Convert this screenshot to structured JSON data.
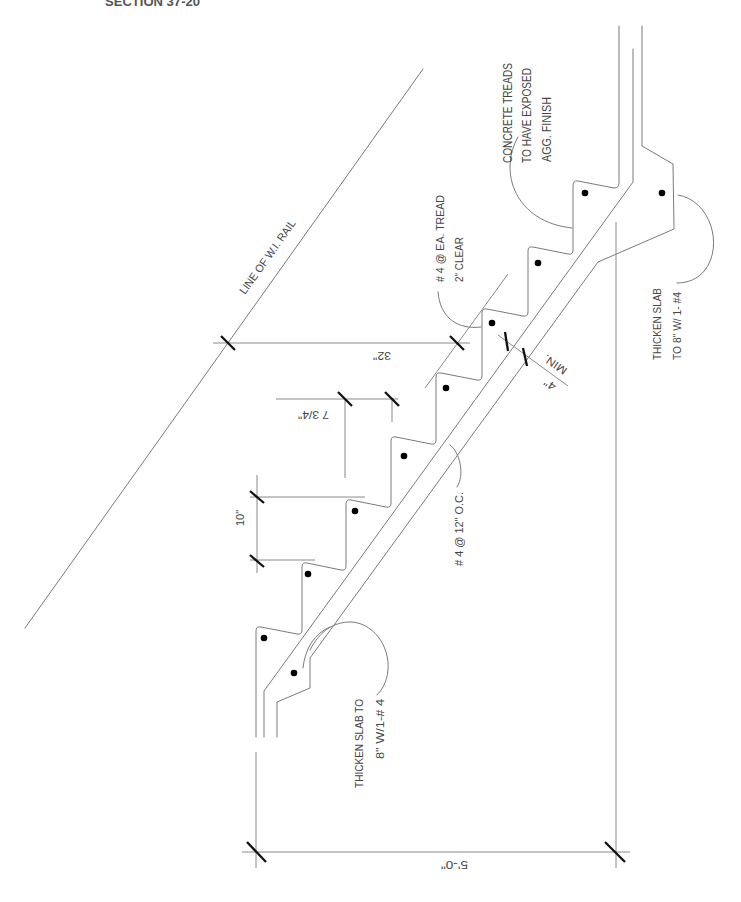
{
  "drawing": {
    "title": "SECTION 37-20",
    "type": "concrete stair section"
  },
  "labels": {
    "concrete_treads": [
      "CONCRETE TREADS",
      "TO HAVE EXPOSED",
      "AGG. FINISH"
    ],
    "tread_rebar": [
      "# 4 @ EA. TREAD",
      "2\" CLEAR"
    ],
    "rail": "LINE OF W.I. RAIL",
    "slab_rebar": "# 4 @ 12\" O.C.",
    "thicken_slab_bottom": [
      "THICKEN SLAB TO",
      "8\" W/1-# 4"
    ],
    "thicken_slab_top": [
      "THICKEN SLAB",
      "TO 8\" W/ 1- #4"
    ]
  },
  "dimensions": {
    "rail_height": "32\"",
    "riser_height": "7 3/4\"",
    "tread_depth": "10\"",
    "slab_min": [
      "4\"",
      "MIN."
    ],
    "overall_run": "5'-0\""
  },
  "colors": {
    "background": "#ffffff",
    "linework": "#7a7a7a",
    "dimension_ticks": "#111111",
    "rebar_dots": "#000000",
    "text": "#454545"
  }
}
